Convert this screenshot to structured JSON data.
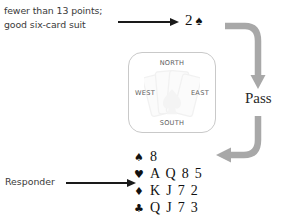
{
  "annotation": {
    "line1": "fewer than 13 points;",
    "line2": "good six-card suit"
  },
  "bid": {
    "level": "2",
    "suit_symbol": "♠",
    "suit_name": "spades"
  },
  "pass": {
    "label": "Pass"
  },
  "responder": {
    "label": "Responder"
  },
  "compass": {
    "north": "NORTH",
    "south": "SOUTH",
    "west": "WEST",
    "east": "EAST"
  },
  "hand": {
    "rows": [
      {
        "suit_symbol": "♠",
        "suit_name": "spades",
        "cards": "8"
      },
      {
        "suit_symbol": "♥",
        "suit_name": "hearts",
        "cards": "A Q 8 5"
      },
      {
        "suit_symbol": "♦",
        "suit_name": "diamonds",
        "cards": "K J 7 2"
      },
      {
        "suit_symbol": "♣",
        "suit_name": "clubs",
        "cards": "Q J 7 3"
      }
    ]
  },
  "colors": {
    "text": "#3a3a3a",
    "ink": "#111111",
    "arrow_gray": "#a8a8a8",
    "panel_border": "#c9c9c9",
    "background": "#ffffff"
  }
}
